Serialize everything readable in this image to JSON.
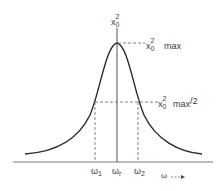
{
  "diagram": {
    "type": "resonance-curve",
    "y_axis_label": {
      "base": "x",
      "sup": "2",
      "sub": "0"
    },
    "x_axis_label": {
      "text": "ω",
      "arrow": "→"
    },
    "peak_label": {
      "base": "x",
      "sup": "2",
      "sub": "0",
      "suffix": "max"
    },
    "half_label": {
      "base": "x",
      "sup": "2",
      "sub": "0",
      "suffix": "max",
      "tail": "/2"
    },
    "ticks": [
      {
        "base": "ω",
        "sub": "1"
      },
      {
        "base": "ω",
        "sub": "r"
      },
      {
        "base": "ω",
        "sub": "2"
      }
    ],
    "colors": {
      "curve": "#2a2a2a",
      "axis": "#555555",
      "dash": "#777777"
    }
  }
}
